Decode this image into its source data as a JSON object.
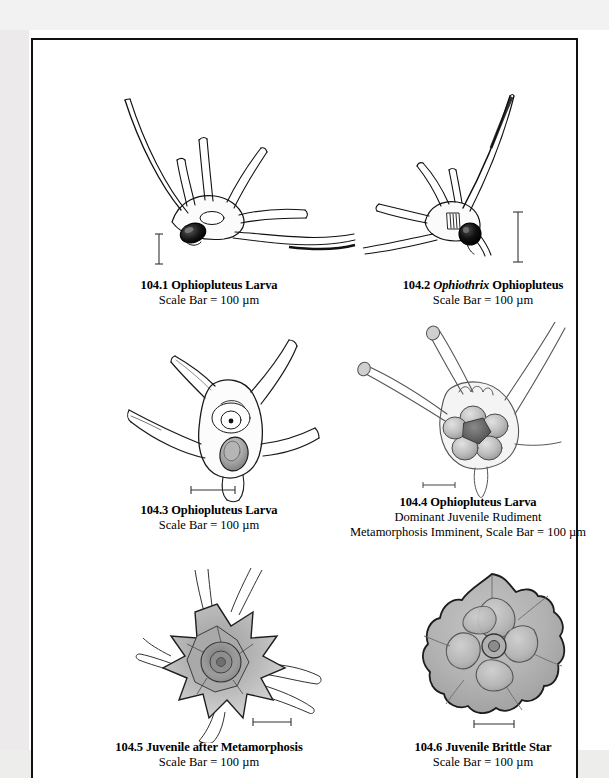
{
  "plate": {
    "figures": [
      {
        "id": "104.1",
        "number": "104.1",
        "title_plain": "104.1 Ophiopluteus Larva",
        "title_pre": "104.1 ",
        "genus": "",
        "title_post": "Ophiopluteus Larva",
        "subtitle": "Scale Bar = 100 µm",
        "scale_bar_orientation": "vertical",
        "subject": "ophiopluteus-larva-lateral"
      },
      {
        "id": "104.2",
        "number": "104.2",
        "title_plain": "104.2 Ophiothrix Ophiopluteus",
        "title_pre": "104.2 ",
        "genus": "Ophiothrix",
        "title_post": " Ophiopluteus",
        "subtitle": "Scale Bar = 100 µm",
        "scale_bar_orientation": "vertical",
        "subject": "ophiothrix-ophiopluteus"
      },
      {
        "id": "104.3",
        "number": "104.3",
        "title_plain": "104.3 Ophiopluteus Larva",
        "title_pre": "104.3 ",
        "genus": "",
        "title_post": "Ophiopluteus Larva",
        "subtitle": "Scale Bar = 100 µm",
        "scale_bar_orientation": "horizontal",
        "subject": "ophiopluteus-larva-with-rudiment"
      },
      {
        "id": "104.4",
        "number": "104.4",
        "title_plain": "104.4 Ophiopluteus Larva",
        "title_pre": "104.4 ",
        "genus": "",
        "title_post": "Ophiopluteus Larva",
        "subtitle_line1": "Dominant Juvenile Rudiment",
        "subtitle_line2": "Metamorphosis Imminent, Scale Bar = 100 µm",
        "scale_bar_orientation": "horizontal",
        "subject": "ophiopluteus-dominant-rudiment"
      },
      {
        "id": "104.5",
        "number": "104.5",
        "title_plain": "104.5 Juvenile after Metamorphosis",
        "title_pre": "104.5 ",
        "genus": "",
        "title_post": "Juvenile after Metamorphosis",
        "subtitle": "Scale Bar = 100 µm",
        "scale_bar_orientation": "horizontal",
        "subject": "juvenile-after-metamorphosis"
      },
      {
        "id": "104.6",
        "number": "104.6",
        "title_plain": "104.6 Juvenile Brittle Star",
        "title_pre": "104.6 ",
        "genus": "",
        "title_post": "Juvenile Brittle Star",
        "subtitle": "Scale Bar = 100 µm",
        "scale_bar_orientation": "horizontal",
        "subject": "juvenile-brittle-star-aboral"
      }
    ]
  },
  "colors": {
    "ink": "#000000",
    "page": "#ffffff",
    "margin": "#ededec",
    "tissue_light": "#f2f2f2",
    "tissue_mid": "#c9c9c9",
    "tissue_dark": "#8f8f8f",
    "stomach_dark": "#1a1a1a"
  }
}
